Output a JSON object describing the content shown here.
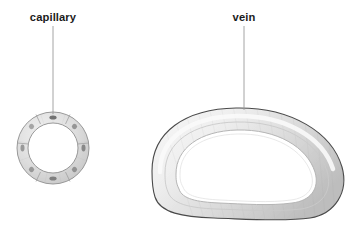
{
  "figure": {
    "type": "biological-diagram",
    "background_color": "#ffffff",
    "width": 356,
    "height": 240
  },
  "labels": {
    "capillary": {
      "text": "capillary",
      "x": 53,
      "y": 20,
      "color": "#1b1b1b"
    },
    "vein": {
      "text": "vein",
      "x": 244,
      "y": 20,
      "color": "#1b1b1b"
    }
  },
  "leaders": {
    "capillary_leader": {
      "x": 53,
      "y_start": 26,
      "y_end": 114,
      "color": "#9a9a9a"
    },
    "vein_leader": {
      "x": 244,
      "y_start": 26,
      "y_end": 110,
      "color": "#9a9a9a"
    }
  },
  "structures": {
    "capillary": {
      "name": "capillary",
      "shape": "ring",
      "center_x": 53,
      "center_y": 148,
      "outer_radius": 36,
      "inner_radius": 25,
      "wall_color": "#d6d6d6",
      "outline_color": "#8c8c8c",
      "lumen_color": "#ffffff",
      "nuclei_count": 8,
      "nuclei_color": "#6e6e6e",
      "segment_divider_color": "#9d9d9d"
    },
    "vein": {
      "name": "vein",
      "shape": "kidney-bean cross-section",
      "outline_color": "#4a4a4a",
      "wall_color": "#d2d2d2",
      "wall_highlight_color": "#f4f4f4",
      "lumen_color": "#ffffff",
      "inner_outline_color": "#bdbdbd",
      "bounds": {
        "left": 151,
        "top": 108,
        "right": 344,
        "bottom": 219
      }
    }
  },
  "colors": {
    "stroke_dark": "#4a4a4a",
    "stroke_mid": "#8c8c8c",
    "stroke_light": "#c4c4c4",
    "fill_light": "#ececec",
    "fill_mid": "#d2d2d2",
    "white": "#ffffff",
    "text": "#1b1b1b"
  }
}
